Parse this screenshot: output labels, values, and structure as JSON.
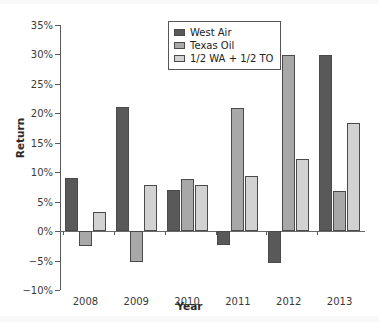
{
  "chart_data": {
    "type": "bar",
    "title": "",
    "xlabel": "Year",
    "ylabel": "Return",
    "categories": [
      "2008",
      "2009",
      "2010",
      "2011",
      "2012",
      "2013"
    ],
    "series": [
      {
        "name": "West Air",
        "color": "#595959",
        "values": [
          9.0,
          21.0,
          7.0,
          -2.3,
          -5.4,
          29.9
        ]
      },
      {
        "name": "Texas Oil",
        "color": "#a8a8a8",
        "values": [
          -2.5,
          -5.3,
          8.8,
          20.9,
          29.9,
          6.8
        ]
      },
      {
        "name": "1/2 WA + 1/2 TO",
        "color": "#d2d2d2",
        "values": [
          3.3,
          7.9,
          7.8,
          9.3,
          12.2,
          18.3
        ]
      }
    ],
    "ylim": [
      -10,
      35
    ],
    "ytick_values": [
      -10,
      -5,
      0,
      5,
      10,
      15,
      20,
      25,
      30,
      35
    ],
    "ytick_labels": [
      "−10%",
      "−5%",
      "0%",
      "5%",
      "10%",
      "15%",
      "20%",
      "25%",
      "30%",
      "35%"
    ],
    "grid": false,
    "legend_position": "top-center",
    "value_suffix": "%"
  }
}
